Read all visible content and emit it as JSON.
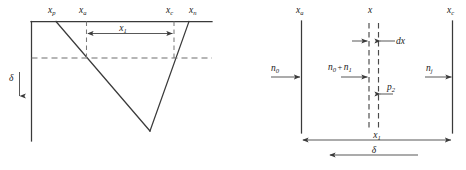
{
  "figure": {
    "background_color": "#ffffff",
    "line_color": "#3a3a3a",
    "dashed_color": "#6e6e6e"
  },
  "left_panel": {
    "name": "deflection-profile-panel",
    "top_labels": [
      {
        "id": "xp",
        "base": "x",
        "sub": "p"
      },
      {
        "id": "xa",
        "base": "x",
        "sub": "a"
      },
      {
        "id": "xc",
        "base": "x",
        "sub": "c"
      },
      {
        "id": "xn",
        "base": "x",
        "sub": "n"
      }
    ],
    "dimension": {
      "id": "x1",
      "base": "x",
      "sub": "1"
    },
    "vertical_label": {
      "id": "delta",
      "symbol": "δ"
    }
  },
  "right_panel": {
    "name": "flux-balance-panel",
    "top_labels": [
      {
        "id": "xa",
        "base": "x",
        "sub": "a"
      },
      {
        "id": "x",
        "base": "x",
        "sub": ""
      },
      {
        "id": "xc",
        "base": "x",
        "sub": "c"
      }
    ],
    "flux_labels": [
      {
        "id": "n0",
        "base": "n",
        "sub": "0"
      },
      {
        "id": "n0n1",
        "base": "n",
        "sub": "0",
        "operator": "+",
        "base2": "n",
        "sub2": "1"
      },
      {
        "id": "nj",
        "base": "n",
        "sub": "j"
      }
    ],
    "element_label": {
      "id": "dx",
      "text": "dx"
    },
    "pressure_label": {
      "id": "p2",
      "base": "p",
      "sub": "2"
    },
    "dimensions": [
      {
        "id": "x1",
        "base": "x",
        "sub": "1"
      },
      {
        "id": "delta",
        "symbol": "δ"
      }
    ]
  }
}
